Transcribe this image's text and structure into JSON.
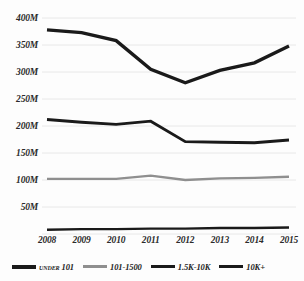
{
  "chart_data": {
    "type": "line",
    "title": "",
    "subtitle": "",
    "xlabel": "",
    "ylabel": "",
    "categories": [
      "2008",
      "2009",
      "2010",
      "2011",
      "2012",
      "2013",
      "2014",
      "2015"
    ],
    "ylim": [
      0,
      400
    ],
    "yticks": [
      50,
      100,
      150,
      200,
      250,
      300,
      350,
      400
    ],
    "ytick_labels": [
      "50M",
      "100M",
      "150M",
      "200M",
      "250M",
      "300M",
      "350M",
      "400M"
    ],
    "grid": true,
    "legend_position": "bottom",
    "value_unit": "M",
    "series": [
      {
        "name": "UNDER 101",
        "color": "#1a1a1a",
        "width": 3.4,
        "values": [
          378,
          373,
          358,
          305,
          280,
          303,
          317,
          348
        ]
      },
      {
        "name": "101-1500",
        "color": "#8f8f8f",
        "width": 2.4,
        "values": [
          102,
          102,
          102,
          108,
          100,
          103,
          104,
          106
        ]
      },
      {
        "name": "1.5K-10K",
        "color": "#1a1a1a",
        "width": 2.9,
        "values": [
          212,
          207,
          203,
          209,
          171,
          170,
          169,
          174
        ]
      },
      {
        "name": "10K+",
        "color": "#1a1a1a",
        "width": 2.4,
        "values": [
          8,
          9,
          9,
          10,
          10,
          11,
          11,
          12
        ]
      }
    ]
  },
  "legend": {
    "items": [
      {
        "label": "Under 101",
        "color": "#1a1a1a",
        "thickness": 4,
        "smallcaps": true
      },
      {
        "label": "101-1500",
        "color": "#8f8f8f",
        "thickness": 3,
        "smallcaps": false
      },
      {
        "label": "1.5K-10K",
        "color": "#1a1a1a",
        "thickness": 3.5,
        "smallcaps": false
      },
      {
        "label": "10K+",
        "color": "#1a1a1a",
        "thickness": 3,
        "smallcaps": false
      }
    ]
  }
}
